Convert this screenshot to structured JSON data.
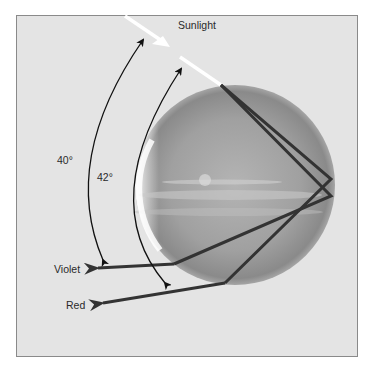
{
  "diagram": {
    "labels": {
      "sunlight": "Sunlight",
      "angle_outer": "40°",
      "angle_inner": "42°",
      "violet": "Violet",
      "red": "Red"
    },
    "colors": {
      "background": "#e4e4e4",
      "frame_border": "#8a8a8a",
      "sunlight_ray": "#ffffff",
      "refracted_rays": "#333333",
      "angle_arcs": "#111111",
      "droplet_mid": "#a8a8a8"
    },
    "elements": [
      "sunlight ray entering droplet",
      "spherical water droplet",
      "two refracted/reflected rays",
      "violet exit ray at 40°",
      "red exit ray at 42°",
      "angle arcs with double arrows"
    ]
  }
}
